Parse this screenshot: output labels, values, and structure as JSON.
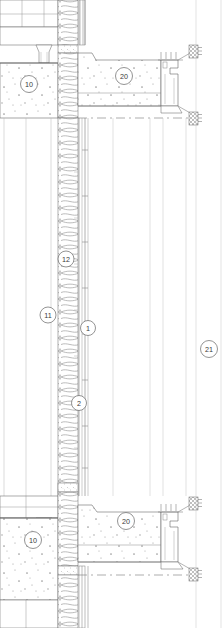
{
  "drawing": {
    "title": "Exterior wall section detail",
    "type": "architectural-section",
    "width": 222,
    "height": 628,
    "background": "#ffffff",
    "line_color": "#555555",
    "hatch_color": "#888888",
    "callout_text_color": "#3a3a3a"
  },
  "callouts": [
    {
      "id": "c10a",
      "label": "10",
      "cx": 29,
      "cy": 84,
      "r": 8.5,
      "note": "concrete floor slab - upper"
    },
    {
      "id": "c20a",
      "label": "20",
      "cx": 124,
      "cy": 76,
      "r": 8.5,
      "note": "concrete topping / spandrel - upper"
    },
    {
      "id": "c12",
      "label": "12",
      "cx": 66,
      "cy": 259,
      "r": 8.0,
      "note": "batt insulation in cavity"
    },
    {
      "id": "c11",
      "label": "11",
      "cx": 48,
      "cy": 315,
      "r": 8.0,
      "note": "wall assembly"
    },
    {
      "id": "c1",
      "label": "1",
      "cx": 88,
      "cy": 328,
      "r": 7.5,
      "note": "exterior cladding panel"
    },
    {
      "id": "c2",
      "label": "2",
      "cx": 79,
      "cy": 403,
      "r": 7.5,
      "note": "vertical support rail"
    },
    {
      "id": "c21",
      "label": "21",
      "cx": 209,
      "cy": 349,
      "r": 8.5,
      "note": "curtain wall glazing"
    },
    {
      "id": "c10b",
      "label": "10",
      "cx": 33,
      "cy": 540,
      "r": 8.5,
      "note": "concrete floor slab - lower"
    },
    {
      "id": "c20b",
      "label": "20",
      "cx": 126,
      "cy": 521,
      "r": 8.5,
      "note": "concrete topping / spandrel - lower"
    }
  ],
  "layers": [
    {
      "name": "concrete-slab-left",
      "x": 0,
      "w": 58,
      "fill": "#ffffff",
      "pattern": "concrete-speckle"
    },
    {
      "name": "insulation-cavity",
      "x": 58,
      "w": 20,
      "fill": "#ffffff",
      "pattern": "batt-loops"
    },
    {
      "name": "air-gap",
      "x": 78,
      "w": 6,
      "fill": "#ffffff",
      "pattern": "none"
    },
    {
      "name": "cladding-panel",
      "x": 84,
      "w": 5,
      "fill": "#ffffff",
      "pattern": "none"
    },
    {
      "name": "spandrel-concrete",
      "x": 89,
      "w": 72,
      "fill": "#ffffff",
      "pattern": "concrete-speckle"
    },
    {
      "name": "curtain-wall-glazing",
      "x": 161,
      "w": 61,
      "fill": "#ffffff",
      "pattern": "none"
    }
  ],
  "bands": [
    {
      "name": "upper-slab-band",
      "y": 0,
      "h": 118
    },
    {
      "name": "mid-wall-band",
      "y": 118,
      "h": 378
    },
    {
      "name": "lower-slab-band",
      "y": 496,
      "h": 132
    }
  ]
}
